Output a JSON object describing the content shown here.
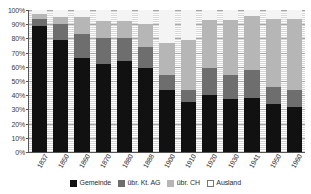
{
  "chart_data": {
    "type": "bar",
    "subtype": "stacked-percentage-column",
    "title": "",
    "subtitle": "",
    "xlabel": "",
    "ylabel": "",
    "ylim": [
      0,
      100
    ],
    "y_unit": "%",
    "grid": true,
    "legend_position": "bottom",
    "categories": [
      "1837",
      "1850",
      "1860",
      "1870",
      "1880",
      "1888",
      "1900",
      "1910",
      "1920",
      "1930",
      "1941",
      "1950",
      "1960"
    ],
    "y_ticks": [
      "0%",
      "10%",
      "20%",
      "30%",
      "40%",
      "50%",
      "60%",
      "70%",
      "80%",
      "90%",
      "100%"
    ],
    "y_tick_values": [
      0,
      10,
      20,
      30,
      40,
      50,
      60,
      70,
      80,
      90,
      100
    ],
    "series": [
      {
        "name": "Gemeinde",
        "color": "#111111",
        "values": [
          89,
          79,
          66,
          62,
          64,
          59,
          44,
          35,
          40,
          37,
          38,
          34,
          32
        ]
      },
      {
        "name": "übr. Kt. AG",
        "color": "#6e6e6e",
        "values": [
          5,
          11,
          17,
          18,
          16,
          15,
          10,
          9,
          19,
          17,
          20,
          12,
          12
        ]
      },
      {
        "name": "übr. CH",
        "color": "#b6b6b6",
        "values": [
          3,
          5,
          12,
          12,
          12,
          16,
          23,
          35,
          34,
          39,
          38,
          48,
          50
        ]
      },
      {
        "name": "Ausland",
        "color": "#f4f4f4",
        "values": [
          3,
          5,
          5,
          8,
          8,
          10,
          23,
          21,
          7,
          7,
          4,
          6,
          6
        ]
      }
    ]
  },
  "legend": {
    "items": [
      {
        "label": "Gemeinde",
        "swatch": "legend-swatch-gemeinde"
      },
      {
        "label": "übr. Kt. AG",
        "swatch": "legend-swatch-kt-ag"
      },
      {
        "label": "übr. CH",
        "swatch": "legend-swatch-ubr-ch"
      },
      {
        "label": "Ausland",
        "swatch": "legend-swatch-ausland"
      }
    ]
  },
  "colors": {
    "gemeinde": "#111111",
    "ubr_kt_ag": "#6e6e6e",
    "ubr_ch": "#b6b6b6",
    "ausland": "#f4f4f4",
    "axis": "#555555",
    "gridline": "#a8a8a8",
    "background": "#ffffff"
  }
}
